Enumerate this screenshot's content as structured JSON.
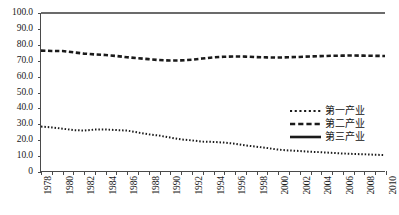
{
  "chart_data": {
    "type": "line",
    "title": "",
    "subtitle": "",
    "xlabel": "",
    "ylabel": "",
    "xlim": [
      1978,
      2010
    ],
    "ylim": [
      0,
      100
    ],
    "grid": false,
    "legend_position": "center-right",
    "y_ticks": [
      "0",
      "10.0",
      "20.0",
      "30.0",
      "40.0",
      "50.0",
      "60.0",
      "70.0",
      "80.0",
      "90.0",
      "100.0"
    ],
    "y_tick_values": [
      0,
      10,
      20,
      30,
      40,
      50,
      60,
      70,
      80,
      90,
      100
    ],
    "x_tick_labels": [
      "1978",
      "1980",
      "1982",
      "1984",
      "1986",
      "1988",
      "1990",
      "1992",
      "1994",
      "1996",
      "1998",
      "2000",
      "2002",
      "2004",
      "2006",
      "2008",
      "2010"
    ],
    "x_tick_values": [
      1978,
      1980,
      1982,
      1984,
      1986,
      1988,
      1990,
      1992,
      1994,
      1996,
      1998,
      2000,
      2002,
      2004,
      2006,
      2008,
      2010
    ],
    "x": [
      1978,
      1979,
      1980,
      1981,
      1982,
      1983,
      1984,
      1985,
      1986,
      1987,
      1988,
      1989,
      1990,
      1991,
      1992,
      1993,
      1994,
      1995,
      1996,
      1997,
      1998,
      1999,
      2000,
      2001,
      2002,
      2003,
      2004,
      2005,
      2006,
      2007,
      2008,
      2009,
      2010
    ],
    "series": [
      {
        "name": "第一产业",
        "style": "dotted",
        "color": "#1a1a1a",
        "values": [
          28.1,
          27.6,
          26.8,
          25.9,
          25.6,
          26.2,
          26.3,
          25.9,
          25.6,
          24.4,
          23.2,
          22.4,
          21.2,
          20.0,
          19.4,
          18.6,
          18.4,
          18.0,
          17.3,
          16.2,
          15.4,
          14.6,
          13.6,
          13.0,
          12.7,
          12.2,
          11.9,
          11.5,
          11.1,
          10.8,
          10.6,
          10.3,
          10.1
        ]
      },
      {
        "name": "第二产业",
        "style": "dashed",
        "color": "#1a1a1a",
        "values": [
          76.2,
          76.0,
          75.9,
          75.1,
          74.3,
          73.8,
          73.4,
          72.8,
          72.0,
          71.4,
          70.8,
          70.2,
          69.9,
          70.0,
          70.4,
          71.2,
          71.9,
          72.3,
          72.5,
          72.4,
          72.1,
          71.9,
          71.8,
          72.0,
          72.2,
          72.5,
          72.7,
          72.9,
          73.0,
          73.1,
          73.0,
          72.9,
          72.8
        ]
      },
      {
        "name": "第三产业",
        "style": "solid",
        "color": "#3a3a3a",
        "values": [
          100,
          100,
          100,
          100,
          100,
          100,
          100,
          100,
          100,
          100,
          100,
          100,
          100,
          100,
          100,
          100,
          100,
          100,
          100,
          100,
          100,
          100,
          100,
          100,
          100,
          100,
          100,
          100,
          100,
          100,
          100,
          100,
          100
        ]
      }
    ]
  },
  "legend": {
    "items": [
      {
        "label": "第一产业",
        "style": "dotted"
      },
      {
        "label": "第二产业",
        "style": "dashed"
      },
      {
        "label": "第三产业",
        "style": "solid"
      }
    ]
  },
  "caption": {
    "text": ""
  }
}
